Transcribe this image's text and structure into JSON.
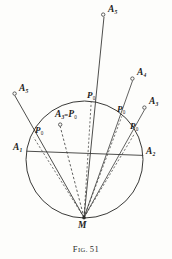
{
  "figure": {
    "caption_prefix": "F",
    "caption_word_rest": "IG.",
    "caption_number": "51",
    "caption_full": "Fig. 51",
    "background_color": "#fdfdfb",
    "ink_color": "#1d1d1b",
    "line_color": "#3a3a38"
  },
  "geometry": {
    "circle": {
      "center_x": 84.5,
      "center_y": 159.5,
      "radius": 58.5,
      "stroke": "#3a3a38",
      "stroke_width": 1.0,
      "fill": "none"
    },
    "vertex_M": {
      "x": 84.0,
      "y": 217.5
    },
    "chord": {
      "x1": 26.5,
      "y1": 151.0,
      "x2": 143.0,
      "y2": 155.5
    }
  },
  "points": {
    "M": {
      "label": "M",
      "x": 84.0,
      "y": 217.5,
      "label_x": 78.0,
      "label_y": 221.0
    },
    "A_top": {
      "label": "A",
      "sub": "5",
      "x": 104.0,
      "y": 14.0,
      "label_x": 108.0,
      "label_y": 9.0
    },
    "A_right_upper": {
      "label": "A",
      "sub": "4",
      "x": 133.0,
      "y": 78.0,
      "label_x": 138.0,
      "label_y": 72.0
    },
    "A_right_lower": {
      "label": "A",
      "sub": "3",
      "x": 145.0,
      "y": 107.0,
      "label_x": 150.0,
      "label_y": 101.0
    },
    "A_left_upper": {
      "label": "A",
      "sub": "5",
      "x": 14.0,
      "y": 93.0,
      "label_x": 19.0,
      "label_y": 88.0
    },
    "A_1": {
      "label": "A",
      "sub": "1",
      "x": 27.0,
      "y": 151.0,
      "label_x": 14.0,
      "label_y": 147.0
    },
    "A_2": {
      "label": "A",
      "sub": "2",
      "x": 143.0,
      "y": 155.5,
      "label_x": 146.0,
      "label_y": 151.0
    },
    "A_eq_P": {
      "label": "A",
      "sub": "3",
      "eq": "=",
      "label2": "P",
      "sub2": "0",
      "x": 60.0,
      "y": 124.0,
      "label_x": 57.0,
      "label_y": 113.0
    },
    "P_topcircle": {
      "label": "P",
      "sub": "0",
      "x": 91.0,
      "y": 102.0,
      "label_x": 88.0,
      "label_y": 95.0
    },
    "P_left": {
      "label": "P",
      "sub": "0",
      "x": 33.5,
      "y": 137.0,
      "label_x": 36.0,
      "label_y": 130.0
    },
    "P_right_upper": {
      "label": "P",
      "sub": "0",
      "x": 122.0,
      "y": 116.0,
      "label_x": 119.0,
      "label_y": 109.0
    },
    "P_right_lower": {
      "label": "P",
      "sub": "0",
      "x": 135.0,
      "y": 133.0,
      "label_x": 132.0,
      "label_y": 126.0
    }
  },
  "rays": [
    {
      "name": "ray-M-to-A5-top",
      "from_x": 84.0,
      "from_y": 217.5,
      "to_x": 104.0,
      "to_y": 16.5,
      "dashed": false
    },
    {
      "name": "ray-M-to-A4-right",
      "from_x": 84.0,
      "from_y": 217.5,
      "to_x": 133.0,
      "to_y": 80.5,
      "dashed": false
    },
    {
      "name": "ray-M-to-A3-right",
      "from_x": 84.0,
      "from_y": 217.5,
      "to_x": 145.0,
      "to_y": 109.5,
      "dashed": false
    },
    {
      "name": "ray-M-to-A5-left",
      "from_x": 84.0,
      "from_y": 217.5,
      "to_x": 14.5,
      "to_y": 95.5,
      "dashed": false
    },
    {
      "name": "ray-M-to-A3-eq-P0",
      "from_x": 84.0,
      "from_y": 217.5,
      "to_x": 60.0,
      "to_y": 126.0,
      "dashed": true
    }
  ],
  "markers": {
    "radius": 1.7,
    "stroke": "#3a3a38",
    "fill": "#fdfdfb"
  }
}
